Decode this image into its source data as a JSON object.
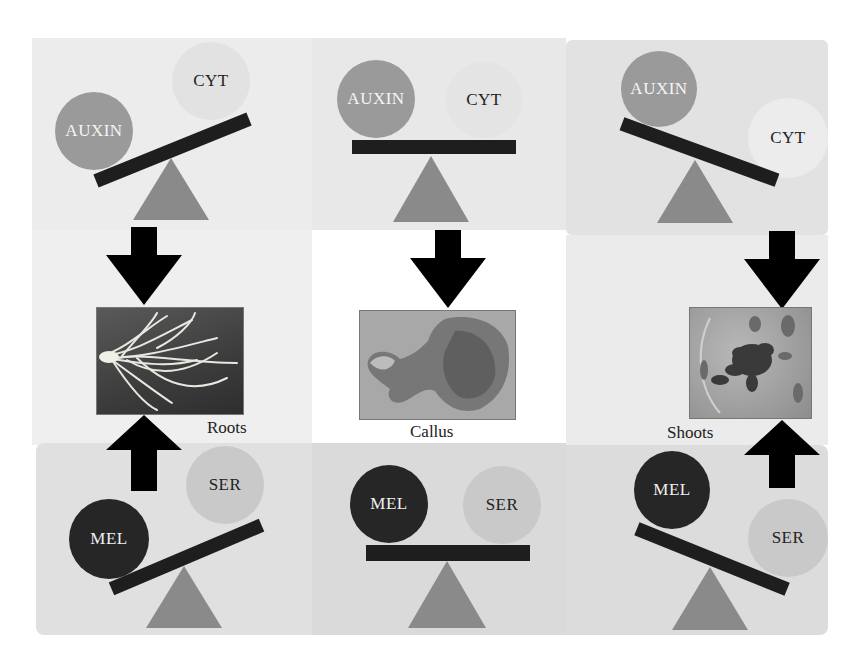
{
  "figure": {
    "colors": {
      "outer_background": "#f0f0f0",
      "top_band": "#e9e9e9",
      "middle_band_left": "#eeeeee",
      "middle_band_center": "#ffffff",
      "middle_band_right": "#ececec",
      "bottom_band": "#dcdcdc",
      "auxin": "#9a9a9a",
      "cyt": "#e4e4e4",
      "mel": "#262626",
      "ser": "#c9c9c9",
      "beam": "#1e1e1e",
      "fulcrum": "#8a8a8a",
      "arrow": "#000000"
    },
    "top_row": [
      {
        "id": "left",
        "heavy": "AUXIN",
        "light": "CYT",
        "tilt": "auxin-down"
      },
      {
        "id": "center",
        "heavy": "AUXIN",
        "light": "CYT",
        "tilt": "balanced"
      },
      {
        "id": "right",
        "heavy": "AUXIN",
        "light": "CYT",
        "tilt": "cyt-down"
      }
    ],
    "outcomes": [
      {
        "id": "roots",
        "label": "Roots",
        "photo": "roots-photo"
      },
      {
        "id": "callus",
        "label": "Callus",
        "photo": "callus-photo"
      },
      {
        "id": "shoots",
        "label": "Shoots",
        "photo": "shoots-photo"
      }
    ],
    "bottom_row": [
      {
        "id": "left",
        "heavy": "MEL",
        "light": "SER",
        "tilt": "mel-down"
      },
      {
        "id": "center",
        "heavy": "MEL",
        "light": "SER",
        "tilt": "balanced"
      },
      {
        "id": "right",
        "heavy": "MEL",
        "light": "SER",
        "tilt": "ser-down"
      }
    ]
  }
}
